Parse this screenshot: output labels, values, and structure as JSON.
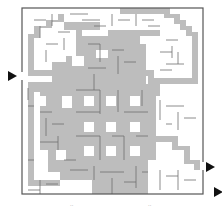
{
  "puzzle": {
    "type": "maze",
    "grid": {
      "cols": 30,
      "rows": 31,
      "left": 22,
      "top": 8,
      "right": 203,
      "bottom": 194
    },
    "colors": {
      "background": "#ffffff",
      "shade": "#bdbdbd",
      "wall": "#6e6e6e",
      "border": "#555555",
      "arrow": "#111111"
    },
    "entry": {
      "side": "left",
      "x": 12,
      "y": 76
    },
    "exits": [
      {
        "side": "right",
        "x": 208,
        "y": 167
      },
      {
        "side": "right",
        "x": 218,
        "y": 192
      }
    ],
    "footer_marks": [
      ".. ",
      ".."
    ]
  }
}
